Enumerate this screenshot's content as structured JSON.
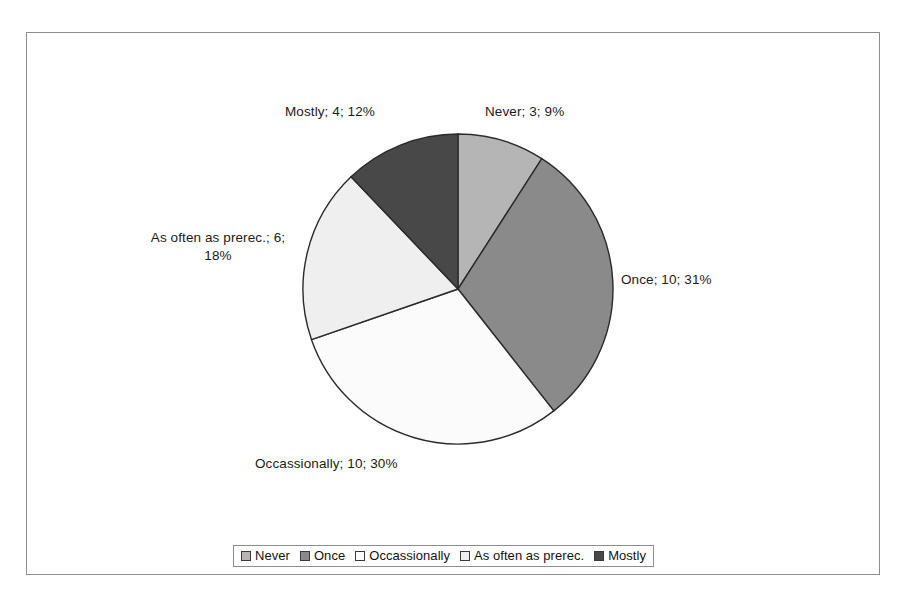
{
  "chart_data": {
    "type": "pie",
    "title": "",
    "subtitle": "",
    "xlabel": "",
    "ylabel": "",
    "legend_position": "bottom",
    "grid": false,
    "total": 33,
    "categories": [
      "Never",
      "Once",
      "Occassionally",
      "As often as prerec.",
      "Mostly"
    ],
    "values": [
      3,
      10,
      10,
      6,
      4
    ],
    "percentages": [
      9,
      31,
      30,
      18,
      12
    ],
    "colors": [
      "#b5b5b5",
      "#8a8a8a",
      "#fbfbfb",
      "#efefef",
      "#484848"
    ],
    "start_angle_deg": 0,
    "direction": "clockwise",
    "slices": [
      {
        "name": "Never",
        "value": 3,
        "percent": 9,
        "color": "#b5b5b5",
        "label": "Never; 3; 9%"
      },
      {
        "name": "Once",
        "value": 10,
        "percent": 31,
        "color": "#8a8a8a",
        "label": "Once; 10; 31%"
      },
      {
        "name": "Occassionally",
        "value": 10,
        "percent": 30,
        "color": "#fbfbfb",
        "label": "Occassionally; 10; 30%"
      },
      {
        "name": "As often as prerec.",
        "value": 6,
        "percent": 18,
        "color": "#efefef",
        "label_line1": "As often as prerec.; 6;",
        "label_line2": "18%"
      },
      {
        "name": "Mostly",
        "value": 4,
        "percent": 12,
        "color": "#484848",
        "label": "Mostly; 4; 12%"
      }
    ]
  },
  "labels": {
    "never": "Never; 3; 9%",
    "once": "Once; 10; 31%",
    "occassionally": "Occassionally; 10; 30%",
    "as_often_line1": "As often as prerec.; 6;",
    "as_often_line2": "18%",
    "mostly": "Mostly; 4; 12%"
  },
  "legend": {
    "items": [
      {
        "label": "Never",
        "color": "#b5b5b5"
      },
      {
        "label": "Once",
        "color": "#8a8a8a"
      },
      {
        "label": "Occassionally",
        "color": "#fbfbfb"
      },
      {
        "label": "As often as prerec.",
        "color": "#efefef"
      },
      {
        "label": "Mostly",
        "color": "#484848"
      }
    ]
  },
  "style": {
    "frame_border": "#8d8d8d",
    "slice_outline": "#2b2b2b",
    "background": "#ffffff",
    "text_color": "#1b1b1b"
  }
}
